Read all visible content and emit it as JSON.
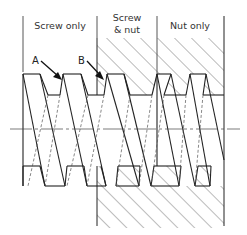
{
  "diagram": {
    "type": "screw-thread-engagement-cross-section",
    "sections": [
      {
        "id": "screw-only",
        "label": "Screw only"
      },
      {
        "id": "screw-and-nut",
        "label_line1": "Screw",
        "label_line2": "& nut"
      },
      {
        "id": "nut-only",
        "label": "Nut only"
      }
    ],
    "callouts": [
      {
        "id": "A",
        "label": "A"
      },
      {
        "id": "B",
        "label": "B"
      }
    ],
    "colors": {
      "line": "#222222",
      "hatch": "#555555",
      "centerline": "#444444",
      "background": "#ffffff"
    }
  }
}
